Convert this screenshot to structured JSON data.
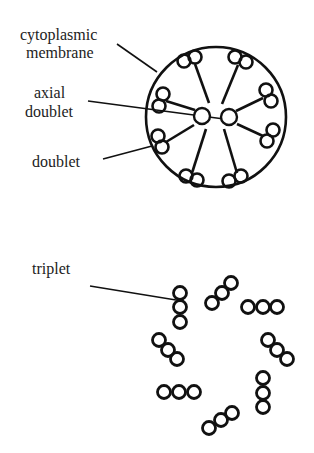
{
  "labels": {
    "cytoplasmic": "cytoplasmic",
    "membrane": "membrane",
    "axial": "axial",
    "axial_doublet": "doublet",
    "doublet": "doublet",
    "triplet": "triplet"
  },
  "flagellum_cross_section": {
    "name": "9+2 axoneme",
    "outer_circle": {
      "cx": 216,
      "cy": 117,
      "r": 70
    },
    "central_pair": [
      {
        "cx": 202,
        "cy": 116,
        "r": 8
      },
      {
        "cx": 229,
        "cy": 117,
        "r": 8
      }
    ],
    "outer_doublets_count": 9
  },
  "basal_body_cross_section": {
    "name": "9x3 triplets",
    "triplets_count": 8
  },
  "colors": {
    "stroke": "#111111",
    "text": "#222222",
    "background": "#ffffff"
  }
}
